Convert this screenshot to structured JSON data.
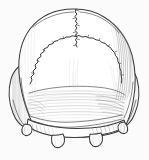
{
  "figure": {
    "kind": "scientific-line-drawing",
    "technique": "pen-and-ink stipple and hatching illustration",
    "title": "",
    "caption": "",
    "background_color": "#fbfbfb",
    "ink_color": "#3a3a3a",
    "shading_color": "#8a8a8a",
    "canvas": {
      "width_px": 149,
      "height_px": 160
    }
  },
  "anatomy": {
    "regions": [
      {
        "id": "parietal-left",
        "label": "left parietal bone",
        "shading": "light"
      },
      {
        "id": "parietal-right",
        "label": "right parietal bone",
        "shading": "dense vertical hatching"
      },
      {
        "id": "occipital-squama",
        "label": "occipital squama",
        "shading": "horizontal hatching band"
      },
      {
        "id": "mastoid-left",
        "label": "left mastoid region",
        "shading": "vertical hatching"
      },
      {
        "id": "mastoid-right",
        "label": "right mastoid region",
        "shading": "dense vertical hatching"
      },
      {
        "id": "condyle-left",
        "label": "left occipital condyle",
        "shading": "outline"
      },
      {
        "id": "condyle-right",
        "label": "right occipital condyle",
        "shading": "outline"
      }
    ],
    "sutures": [
      {
        "id": "sagittal-suture",
        "label": "sagittal suture",
        "path_type": "vertical zigzag, midline upper"
      },
      {
        "id": "lambdoid-suture",
        "label": "lambdoid suture",
        "path_type": "broad jagged arc across mid cranium"
      },
      {
        "id": "lambda",
        "label": "lambda",
        "path_type": "junction point of sagittal and lambdoid sutures"
      }
    ],
    "landmarks": [
      {
        "id": "nuchal-line-superior",
        "label": "superior nuchal line"
      },
      {
        "id": "nuchal-line-inferior",
        "label": "inferior nuchal line"
      },
      {
        "id": "foramen-magnum-margin",
        "label": "posterior margin of foramen magnum"
      }
    ]
  }
}
